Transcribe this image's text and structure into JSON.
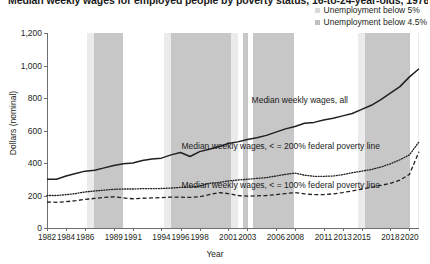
{
  "title": "Median weekly wages for employed people by poverty status, 16-to-24-year-olds, 1978–2021",
  "legend": {
    "position": "top-right",
    "items": [
      {
        "label": "Unemployment below 5%",
        "color": "#d9d9d9",
        "marker": "square"
      },
      {
        "label": "Unemployment below 4.5%",
        "color": "#bfbfbf",
        "marker": "square"
      }
    ]
  },
  "axes": {
    "ylabel": "Dollars (nominal)",
    "xlabel": "Year",
    "yticks": [
      "0",
      "200",
      "400",
      "600",
      "800",
      "1,000",
      "1,200"
    ],
    "ytick_values": [
      0,
      200,
      400,
      600,
      800,
      1000,
      1200
    ],
    "ylim": [
      0,
      1200
    ],
    "xticks": [
      "1982",
      "1984",
      "1986",
      "1989",
      "1991",
      "1994",
      "1996",
      "1998",
      "2001",
      "2003",
      "2006",
      "2008",
      "2011",
      "2013",
      "2015",
      "2018",
      "2020"
    ],
    "xtick_values": [
      1982,
      1984,
      1986,
      1989,
      1991,
      1994,
      1996,
      1998,
      2001,
      2003,
      2006,
      2008,
      2011,
      2013,
      2015,
      2018,
      2020
    ],
    "xlim": [
      1982,
      2021
    ]
  },
  "annotations": [
    {
      "text": "Median weekly wages, all",
      "x": 2008.5,
      "y": 790
    },
    {
      "text": "Median weekly wages, < = 200% federal poverty line",
      "x": 2006.5,
      "y": 505
    },
    {
      "text": "Median weekly wages, < = 100% federal poverty line",
      "x": 2006.5,
      "y": 265
    }
  ],
  "chart_data": {
    "type": "line",
    "title": "Median weekly wages for employed people by poverty status, 16-to-24-year-olds, 1978–2021",
    "xlabel": "Year",
    "ylabel": "Dollars (nominal)",
    "ylim": [
      0,
      1200
    ],
    "xlim": [
      1982,
      2021
    ],
    "grid": false,
    "legend_position": "top-right",
    "x": [
      1982,
      1983,
      1984,
      1985,
      1986,
      1987,
      1988,
      1989,
      1990,
      1991,
      1992,
      1993,
      1994,
      1995,
      1996,
      1997,
      1998,
      1999,
      2000,
      2001,
      2002,
      2003,
      2004,
      2005,
      2006,
      2007,
      2008,
      2009,
      2010,
      2011,
      2012,
      2013,
      2014,
      2015,
      2016,
      2017,
      2018,
      2019,
      2020,
      2021
    ],
    "series": [
      {
        "name": "Median weekly wages, all",
        "style": "solid",
        "color": "#231f20",
        "values": [
          300,
          300,
          320,
          335,
          350,
          355,
          370,
          385,
          395,
          400,
          415,
          425,
          430,
          450,
          465,
          440,
          470,
          485,
          500,
          520,
          530,
          545,
          555,
          570,
          590,
          610,
          625,
          645,
          650,
          665,
          675,
          690,
          705,
          730,
          755,
          790,
          830,
          870,
          930,
          980
        ]
      },
      {
        "name": "Median weekly wages, < = 200% federal poverty line",
        "style": "dotted",
        "color": "#231f20",
        "values": [
          200,
          200,
          205,
          212,
          222,
          228,
          233,
          238,
          240,
          240,
          242,
          242,
          243,
          246,
          250,
          252,
          258,
          275,
          280,
          290,
          295,
          300,
          305,
          310,
          320,
          330,
          338,
          325,
          318,
          318,
          320,
          328,
          340,
          350,
          360,
          375,
          395,
          420,
          450,
          530
        ]
      },
      {
        "name": "Median weekly wages, < = 100% federal poverty line",
        "style": "dashed",
        "color": "#231f20",
        "values": [
          160,
          158,
          162,
          168,
          176,
          182,
          188,
          192,
          185,
          180,
          183,
          185,
          187,
          190,
          190,
          188,
          192,
          205,
          218,
          212,
          200,
          196,
          198,
          200,
          205,
          212,
          218,
          210,
          205,
          206,
          210,
          218,
          228,
          240,
          250,
          262,
          275,
          295,
          330,
          470
        ]
      }
    ],
    "shaded_bands": [
      {
        "label": "Unemployment below 5%",
        "start": 1986.2,
        "end": 1986.9,
        "color": "#ebebeb"
      },
      {
        "label": "Unemployment below 4.5%",
        "start": 1986.9,
        "end": 1990.0,
        "color": "#c7c7c7"
      },
      {
        "label": "Unemployment below 5%",
        "start": 1994.3,
        "end": 1995.0,
        "color": "#ebebeb"
      },
      {
        "label": "Unemployment below 4.5%",
        "start": 1995.0,
        "end": 2001.3,
        "color": "#c7c7c7"
      },
      {
        "label": "Unemployment below 5%",
        "start": 2001.3,
        "end": 2002.0,
        "color": "#ebebeb"
      },
      {
        "label": "Unemployment below 4.5%",
        "start": 2002.5,
        "end": 2003.1,
        "color": "#c7c7c7"
      },
      {
        "label": "Unemployment below 4.5%",
        "start": 2003.6,
        "end": 2007.9,
        "color": "#c7c7c7"
      },
      {
        "label": "Unemployment below 5%",
        "start": 2014.6,
        "end": 2015.3,
        "color": "#ebebeb"
      },
      {
        "label": "Unemployment below 4.5%",
        "start": 2015.3,
        "end": 2020.1,
        "color": "#c7c7c7"
      },
      {
        "label": "Unemployment below 5%",
        "start": 2020.9,
        "end": 2021.2,
        "color": "#ebebeb"
      }
    ]
  }
}
